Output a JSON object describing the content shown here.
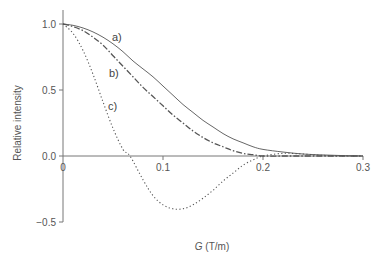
{
  "chart_data": {
    "type": "line",
    "title": "",
    "xlabel": "G (T/m)",
    "xlabel_italic_part": "G",
    "xlabel_unit_part": " (T/m)",
    "ylabel": "Relative intensity",
    "xlim": [
      0,
      0.3
    ],
    "ylim": [
      -0.5,
      1.0
    ],
    "x_ticks": [
      0.1,
      0.2,
      0.3
    ],
    "x_tick_labels": [
      "0.1",
      "0.2",
      "0.3"
    ],
    "y_ticks": [
      1.0,
      0.5,
      0.0,
      -0.5
    ],
    "y_tick_labels": [
      "1.0",
      "0.5",
      "0.0",
      "−0.5"
    ],
    "origin_label": "0",
    "grid": false,
    "legend": "inline labels",
    "series": [
      {
        "name": "a)",
        "style": "solid",
        "x": [
          0,
          0.01,
          0.02,
          0.03,
          0.04,
          0.05,
          0.06,
          0.07,
          0.08,
          0.09,
          0.1,
          0.11,
          0.12,
          0.13,
          0.14,
          0.15,
          0.16,
          0.17,
          0.18,
          0.19,
          0.2,
          0.22,
          0.24,
          0.26,
          0.28,
          0.3
        ],
        "values": [
          1.0,
          0.99,
          0.97,
          0.94,
          0.9,
          0.85,
          0.79,
          0.72,
          0.66,
          0.6,
          0.53,
          0.46,
          0.39,
          0.33,
          0.27,
          0.22,
          0.17,
          0.13,
          0.1,
          0.07,
          0.05,
          0.03,
          0.015,
          0.008,
          0.003,
          0.0
        ]
      },
      {
        "name": "b)",
        "style": "dash-dot",
        "x": [
          0,
          0.01,
          0.02,
          0.03,
          0.04,
          0.05,
          0.06,
          0.07,
          0.08,
          0.09,
          0.1,
          0.11,
          0.12,
          0.13,
          0.14,
          0.15,
          0.16,
          0.17,
          0.18,
          0.19,
          0.2,
          0.22,
          0.24,
          0.26,
          0.28,
          0.3
        ],
        "values": [
          1.0,
          0.98,
          0.95,
          0.9,
          0.84,
          0.76,
          0.68,
          0.6,
          0.52,
          0.45,
          0.38,
          0.31,
          0.25,
          0.19,
          0.14,
          0.1,
          0.07,
          0.04,
          0.02,
          0.01,
          0.0,
          0.0,
          0.0,
          0.0,
          0.0,
          0.0
        ]
      },
      {
        "name": "c)",
        "style": "dotted",
        "x": [
          0,
          0.01,
          0.02,
          0.03,
          0.04,
          0.05,
          0.06,
          0.067,
          0.08,
          0.09,
          0.1,
          0.11,
          0.12,
          0.13,
          0.14,
          0.15,
          0.16,
          0.17,
          0.18,
          0.19,
          0.2,
          0.22,
          0.24,
          0.26,
          0.28,
          0.3
        ],
        "values": [
          1.0,
          0.93,
          0.8,
          0.62,
          0.41,
          0.21,
          0.05,
          0.0,
          -0.18,
          -0.3,
          -0.37,
          -0.4,
          -0.4,
          -0.37,
          -0.32,
          -0.26,
          -0.19,
          -0.13,
          -0.07,
          -0.03,
          0.0,
          0.02,
          0.015,
          0.005,
          0.0,
          0.0
        ]
      }
    ],
    "line_color": "#555555"
  }
}
